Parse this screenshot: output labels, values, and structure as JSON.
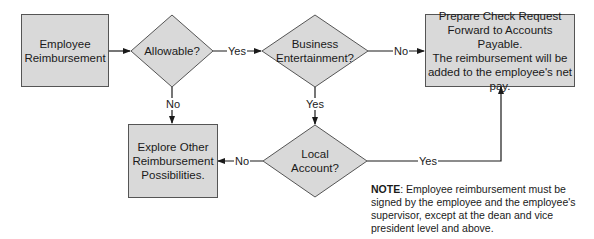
{
  "nodes": {
    "employee_reimbursement": {
      "line1": "Employee",
      "line2": "Reimbursement"
    },
    "allowable": {
      "label": "Allowable?"
    },
    "business_entertainment": {
      "line1": "Business",
      "line2": "Entertainment?"
    },
    "prepare_check": {
      "line1": "Prepare Check Request",
      "line2": "Forward to Accounts Payable.",
      "line3": "The reimbursement will be",
      "line4": "added to the employee's net",
      "line5": "pay."
    },
    "local_account": {
      "line1": "Local",
      "line2": "Account?"
    },
    "explore_other": {
      "line1": "Explore Other",
      "line2": "Reimbursement",
      "line3": "Possibilities."
    }
  },
  "edges": {
    "allowable_yes": "Yes",
    "allowable_no": "No",
    "business_no": "No",
    "business_yes": "Yes",
    "local_no": "No",
    "local_yes": "Yes"
  },
  "note": {
    "label": "NOTE",
    "text": ": Employee reimbursement must be signed by the employee and the employee's supervisor, except at the dean and vice president level and above."
  },
  "colors": {
    "fill": "#d9d9d9",
    "stroke": "#555555",
    "line": "#1a1a1a"
  }
}
